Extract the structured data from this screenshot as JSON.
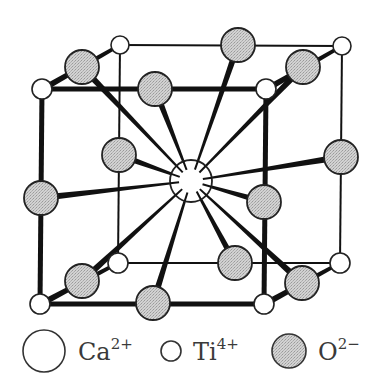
{
  "diagram": {
    "colors": {
      "line": "#111111",
      "oxygen_fill": "#c8c8c8",
      "cation_fill": "#ffffff",
      "outline": "#222222"
    },
    "calcium": {
      "x": 191,
      "y": 181,
      "r": 21
    },
    "titanium": [
      {
        "id": "ti-front-top-left",
        "x": 42,
        "y": 89,
        "r": 10
      },
      {
        "id": "ti-front-top-right",
        "x": 266,
        "y": 89,
        "r": 10
      },
      {
        "id": "ti-front-bottom-left",
        "x": 40,
        "y": 304,
        "r": 10
      },
      {
        "id": "ti-front-bottom-right",
        "x": 264,
        "y": 304,
        "r": 10
      },
      {
        "id": "ti-back-top-left",
        "x": 120,
        "y": 45,
        "r": 9
      },
      {
        "id": "ti-back-top-right",
        "x": 342,
        "y": 46,
        "r": 9
      },
      {
        "id": "ti-back-bottom-left",
        "x": 118,
        "y": 263,
        "r": 10
      },
      {
        "id": "ti-back-bottom-right",
        "x": 340,
        "y": 263,
        "r": 10
      }
    ],
    "oxygen": [
      {
        "id": "o-top-front",
        "x": 155,
        "y": 89,
        "r": 17
      },
      {
        "id": "o-top-back",
        "x": 238,
        "y": 45,
        "r": 17
      },
      {
        "id": "o-top-left",
        "x": 82,
        "y": 67,
        "r": 17
      },
      {
        "id": "o-top-right",
        "x": 303,
        "y": 67,
        "r": 17
      },
      {
        "id": "o-left-front",
        "x": 41,
        "y": 198,
        "r": 17
      },
      {
        "id": "o-left-back",
        "x": 119,
        "y": 155,
        "r": 17
      },
      {
        "id": "o-right-front",
        "x": 264,
        "y": 202,
        "r": 17
      },
      {
        "id": "o-right-back",
        "x": 341,
        "y": 157,
        "r": 17
      },
      {
        "id": "o-bottom-front",
        "x": 153,
        "y": 303,
        "r": 17
      },
      {
        "id": "o-bottom-back",
        "x": 235,
        "y": 263,
        "r": 17
      },
      {
        "id": "o-bottom-left",
        "x": 82,
        "y": 281,
        "r": 17
      },
      {
        "id": "o-bottom-right",
        "x": 302,
        "y": 283,
        "r": 17
      }
    ]
  },
  "legend": {
    "items": [
      {
        "label": "Ca",
        "charge": "2+",
        "kind": "calcium",
        "x": 44,
        "y": 351,
        "r": 21,
        "text_x": 78
      },
      {
        "label": "Ti",
        "charge": "4+",
        "kind": "titanium",
        "x": 171,
        "y": 351,
        "r": 10,
        "text_x": 193
      },
      {
        "label": "O",
        "charge": "2−",
        "kind": "oxygen",
        "x": 289,
        "y": 351,
        "r": 17,
        "text_x": 318
      }
    ]
  }
}
